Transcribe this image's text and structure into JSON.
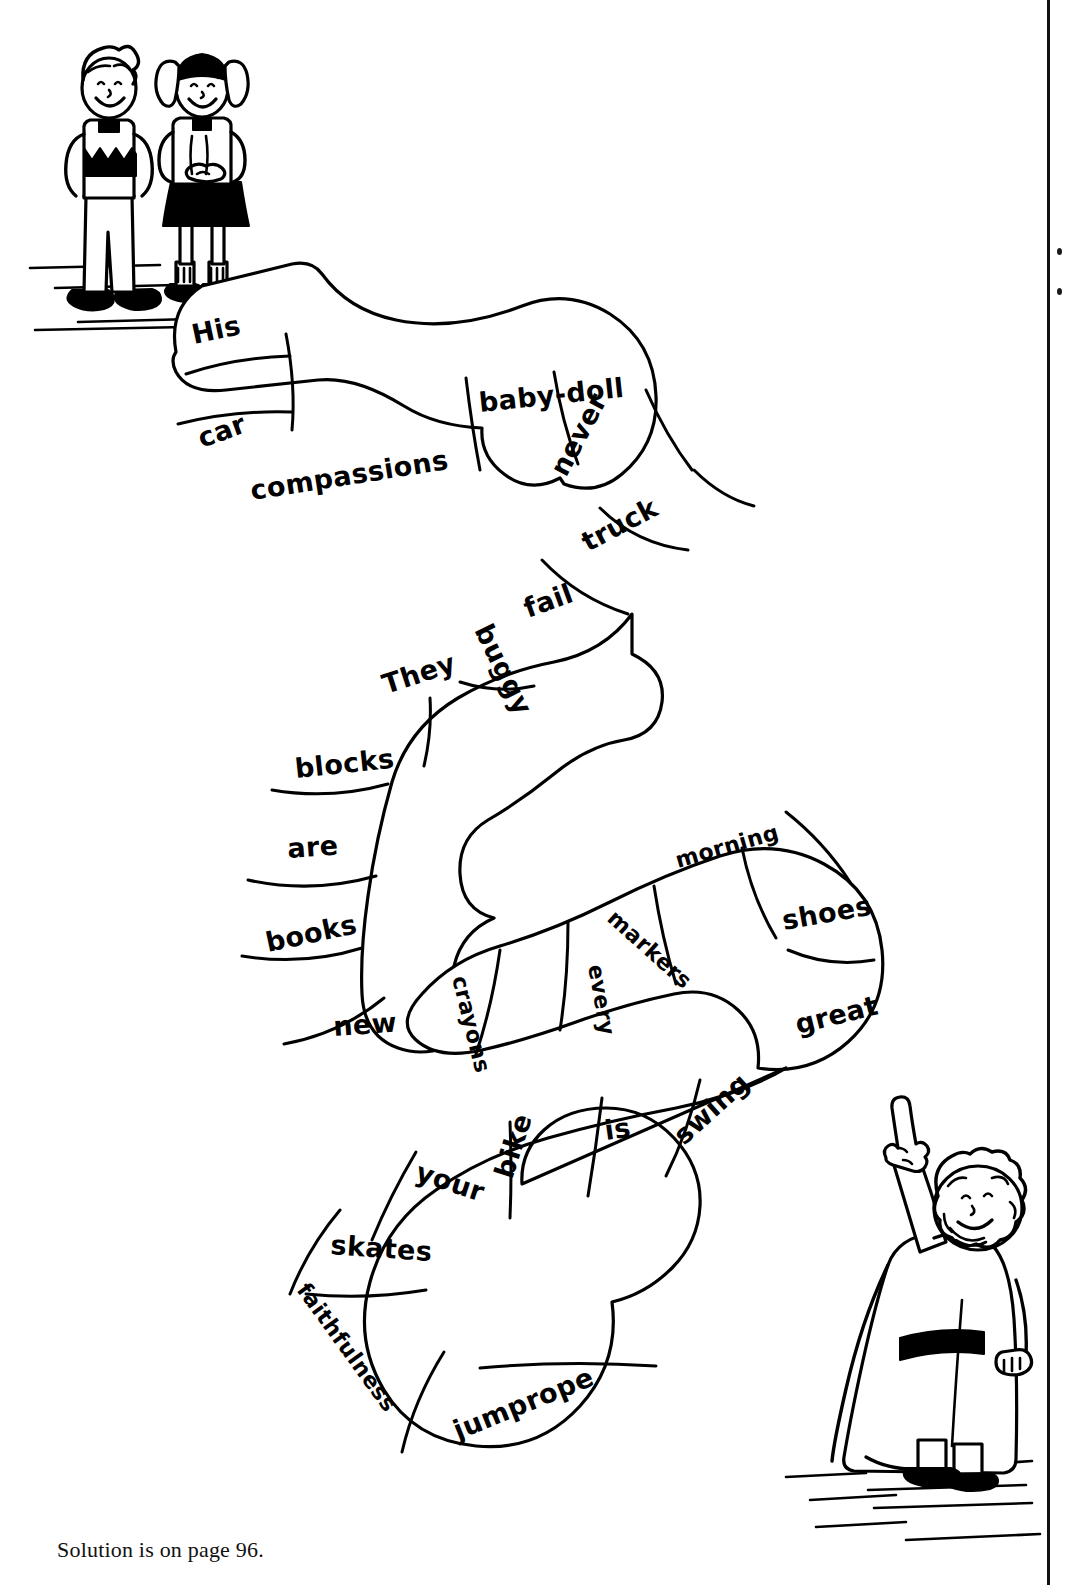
{
  "page": {
    "caption": "Solution is on page 96.",
    "background_color": "#ffffff",
    "ink_color": "#000000"
  },
  "margin": {
    "rule_label": "page-gutter-rule",
    "dots": [
      "dot",
      "dot"
    ]
  },
  "illustrations": [
    {
      "id": "children",
      "label": "two-children-standing",
      "description": "boy in zigzag-pattern sweater and girl with pigtails and dark skirt",
      "position": "top-left"
    },
    {
      "id": "prophet",
      "label": "bearded-man-pointing-up",
      "description": "robed bearded man with dark sash pointing upward with index finger",
      "position": "bottom-right"
    }
  ],
  "puzzle": {
    "type": "winding-word-path",
    "segment_count": 26,
    "segments": [
      {
        "index": 1,
        "word": "His"
      },
      {
        "index": 2,
        "word": "car"
      },
      {
        "index": 3,
        "word": "compassions"
      },
      {
        "index": 4,
        "word": "baby-doll"
      },
      {
        "index": 5,
        "word": "never"
      },
      {
        "index": 6,
        "word": "truck"
      },
      {
        "index": 7,
        "word": "fail"
      },
      {
        "index": 8,
        "word": "buggy"
      },
      {
        "index": 9,
        "word": "They"
      },
      {
        "index": 10,
        "word": "blocks"
      },
      {
        "index": 11,
        "word": "are"
      },
      {
        "index": 12,
        "word": "books"
      },
      {
        "index": 13,
        "word": "new"
      },
      {
        "index": 14,
        "word": "crayons"
      },
      {
        "index": 15,
        "word": "every"
      },
      {
        "index": 16,
        "word": "markers"
      },
      {
        "index": 17,
        "word": "morning"
      },
      {
        "index": 18,
        "word": "shoes"
      },
      {
        "index": 19,
        "word": "great"
      },
      {
        "index": 20,
        "word": "swing"
      },
      {
        "index": 21,
        "word": "is"
      },
      {
        "index": 22,
        "word": "bike"
      },
      {
        "index": 23,
        "word": "your"
      },
      {
        "index": 24,
        "word": "skates"
      },
      {
        "index": 25,
        "word": "faithfulness"
      },
      {
        "index": 26,
        "word": "jumprope"
      }
    ]
  }
}
